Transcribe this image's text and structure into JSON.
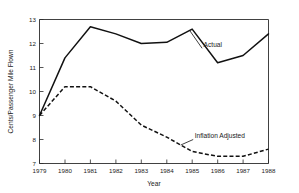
{
  "chart_data": {
    "type": "line",
    "title": "",
    "xlabel": "Year",
    "ylabel": "Cents/Passenger Mile Flown",
    "x": [
      1979,
      1980,
      1981,
      1982,
      1983,
      1984,
      1985,
      1986,
      1987,
      1988
    ],
    "xticklabels": [
      "1979",
      "1980",
      "1981",
      "1982",
      "1983",
      "1984",
      "1985",
      "1986",
      "1987",
      "1988"
    ],
    "yticklabels": [
      "7",
      "8",
      "9",
      "10",
      "11",
      "12",
      "13"
    ],
    "yticks": [
      7,
      8,
      9,
      10,
      11,
      12,
      13
    ],
    "xlim": [
      1979,
      1988
    ],
    "ylim": [
      7,
      13
    ],
    "grid": false,
    "legend_position": "inline-annotations",
    "series": [
      {
        "name": "Actual",
        "style": "solid",
        "color": "#111111",
        "values": [
          9.0,
          11.4,
          12.7,
          12.4,
          12.0,
          12.05,
          12.6,
          11.2,
          11.5,
          12.4
        ],
        "annotation": {
          "text": "Actual",
          "x": 1985.45,
          "y": 11.85
        }
      },
      {
        "name": "Inflation Adjusted",
        "style": "dashed",
        "color": "#111111",
        "values": [
          9.0,
          10.2,
          10.2,
          9.6,
          8.6,
          8.1,
          7.5,
          7.3,
          7.3,
          7.6
        ],
        "annotation": {
          "text": "Inflation Adjusted",
          "x": 1985.1,
          "y": 8.05
        }
      }
    ]
  }
}
